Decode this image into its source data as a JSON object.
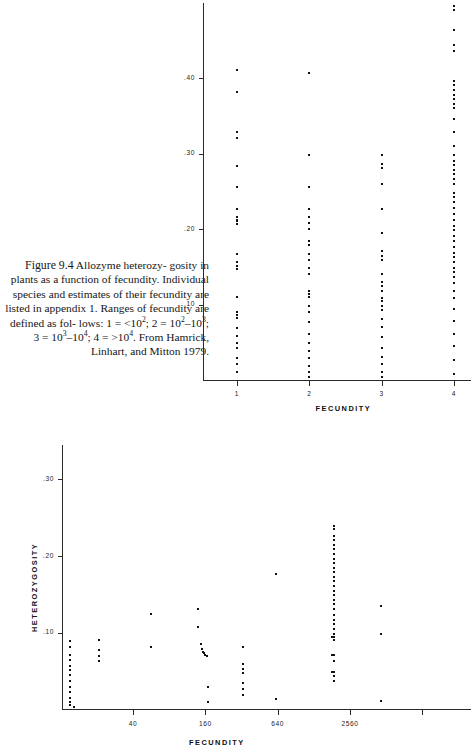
{
  "caption": {
    "figure_number": "Figure 9.4",
    "line1": "Allozyme heterozy-",
    "line2": "gosity in plants as a function of",
    "line3": "fecundity. Individual species",
    "line4": "and estimates of their fecundity",
    "line5": "are listed in appendix 1. Ranges",
    "line6": "of fecundity are defined as fol-",
    "line7_pre": "lows: 1 = <10",
    "line7_sup1": "2",
    "line7_mid1": "; 2 = 10",
    "line7_sup2": "2",
    "line7_dash1": "–10",
    "line7_sup3": "3",
    "line7_end": "; 3",
    "line8_pre": "= 10",
    "line8_sup1": "3",
    "line8_dash": "–10",
    "line8_sup2": "4",
    "line8_mid": "; 4 = >10",
    "line8_sup3": "4",
    "line8_end": ". From",
    "line9": "Hamrick, Linhart, and Mitton",
    "line10": "1979."
  },
  "chart_data": [
    {
      "id": "top",
      "type": "scatter",
      "title": "",
      "xlabel": "FECUNDITY",
      "ylabel": "",
      "x_tick_labels": [
        "1",
        "2",
        "3",
        "4"
      ],
      "x_categories": [
        1,
        2,
        3,
        4
      ],
      "y_tick_labels": [
        ".10",
        ".20",
        ".30",
        ".40"
      ],
      "y_tick_values": [
        0.1,
        0.2,
        0.3,
        0.4
      ],
      "ylim": [
        0.0,
        0.5
      ],
      "grid": false,
      "legend": "none",
      "series": [
        {
          "name": "Fecundity class 1",
          "x": 1,
          "values": [
            0.413,
            0.383,
            0.33,
            0.322,
            0.285,
            0.258,
            0.228,
            0.218,
            0.214,
            0.212,
            0.208,
            0.168,
            0.158,
            0.152,
            0.148,
            0.112,
            0.092,
            0.088,
            0.084,
            0.07,
            0.06,
            0.05,
            0.044,
            0.03,
            0.022,
            0.012
          ]
        },
        {
          "name": "Fecundity class 2",
          "x": 2,
          "values": [
            0.408,
            0.3,
            0.258,
            0.228,
            0.218,
            0.21,
            0.202,
            0.186,
            0.18,
            0.168,
            0.16,
            0.15,
            0.142,
            0.12,
            0.116,
            0.112,
            0.1,
            0.092,
            0.078,
            0.062,
            0.05,
            0.04,
            0.03,
            0.02,
            0.012,
            0.006
          ]
        },
        {
          "name": "Fecundity class 3",
          "x": 3,
          "values": [
            0.3,
            0.288,
            0.282,
            0.262,
            0.228,
            0.196,
            0.172,
            0.166,
            0.16,
            0.142,
            0.132,
            0.126,
            0.12,
            0.11,
            0.106,
            0.1,
            0.094,
            0.082,
            0.072,
            0.058,
            0.044,
            0.032,
            0.022,
            0.012,
            0.006
          ]
        },
        {
          "name": "Fecundity class 4",
          "x": 4,
          "values": [
            0.498,
            0.492,
            0.466,
            0.446,
            0.438,
            0.398,
            0.392,
            0.386,
            0.38,
            0.374,
            0.368,
            0.362,
            0.348,
            0.33,
            0.312,
            0.3,
            0.292,
            0.286,
            0.28,
            0.274,
            0.268,
            0.262,
            0.25,
            0.244,
            0.238,
            0.23,
            0.222,
            0.214,
            0.206,
            0.2,
            0.192,
            0.186,
            0.178,
            0.17,
            0.164,
            0.158,
            0.15,
            0.144,
            0.138,
            0.13,
            0.12,
            0.11,
            0.096,
            0.08,
            0.062,
            0.046,
            0.028,
            0.01
          ]
        }
      ]
    },
    {
      "id": "bottom",
      "type": "scatter",
      "title": "",
      "xlabel": "FECUNDITY",
      "ylabel": "HETEROZYGOSITY",
      "x_scale": "log",
      "x_tick_labels": [
        "40",
        "160",
        "640",
        "2560"
      ],
      "x_tick_values": [
        40,
        160,
        640,
        2560
      ],
      "y_tick_labels": [
        ".10",
        ".20",
        ".30"
      ],
      "y_tick_values": [
        0.1,
        0.2,
        0.3
      ],
      "ylim": [
        0.0,
        0.345
      ],
      "grid": false,
      "legend": "none",
      "points": [
        {
          "x": 10,
          "y": 0.112
        },
        {
          "x": 10,
          "y": 0.068
        },
        {
          "x": 12,
          "y": 0.09
        },
        {
          "x": 12,
          "y": 0.082
        },
        {
          "x": 12,
          "y": 0.072
        },
        {
          "x": 12,
          "y": 0.066
        },
        {
          "x": 12,
          "y": 0.058
        },
        {
          "x": 12,
          "y": 0.052
        },
        {
          "x": 12,
          "y": 0.046
        },
        {
          "x": 12,
          "y": 0.038
        },
        {
          "x": 12,
          "y": 0.03
        },
        {
          "x": 12,
          "y": 0.024
        },
        {
          "x": 12,
          "y": 0.016
        },
        {
          "x": 12,
          "y": 0.01
        },
        {
          "x": 12,
          "y": 0.006
        },
        {
          "x": 13,
          "y": 0.004
        },
        {
          "x": 21,
          "y": 0.092
        },
        {
          "x": 21,
          "y": 0.078
        },
        {
          "x": 21,
          "y": 0.07
        },
        {
          "x": 21,
          "y": 0.064
        },
        {
          "x": 56,
          "y": 0.126
        },
        {
          "x": 56,
          "y": 0.082
        },
        {
          "x": 140,
          "y": 0.132
        },
        {
          "x": 140,
          "y": 0.108
        },
        {
          "x": 148,
          "y": 0.086
        },
        {
          "x": 150,
          "y": 0.08
        },
        {
          "x": 152,
          "y": 0.076
        },
        {
          "x": 156,
          "y": 0.074
        },
        {
          "x": 160,
          "y": 0.072
        },
        {
          "x": 164,
          "y": 0.07
        },
        {
          "x": 168,
          "y": 0.03
        },
        {
          "x": 168,
          "y": 0.01
        },
        {
          "x": 330,
          "y": 0.082
        },
        {
          "x": 330,
          "y": 0.06
        },
        {
          "x": 330,
          "y": 0.054
        },
        {
          "x": 330,
          "y": 0.048
        },
        {
          "x": 330,
          "y": 0.036
        },
        {
          "x": 330,
          "y": 0.028
        },
        {
          "x": 330,
          "y": 0.02
        },
        {
          "x": 620,
          "y": 0.178
        },
        {
          "x": 620,
          "y": 0.014
        },
        {
          "x": 1900,
          "y": 0.24
        },
        {
          "x": 1900,
          "y": 0.236
        },
        {
          "x": 1900,
          "y": 0.228
        },
        {
          "x": 1900,
          "y": 0.222
        },
        {
          "x": 1900,
          "y": 0.216
        },
        {
          "x": 1900,
          "y": 0.21
        },
        {
          "x": 1900,
          "y": 0.204
        },
        {
          "x": 1900,
          "y": 0.198
        },
        {
          "x": 1900,
          "y": 0.192
        },
        {
          "x": 1900,
          "y": 0.186
        },
        {
          "x": 1900,
          "y": 0.18
        },
        {
          "x": 1900,
          "y": 0.174
        },
        {
          "x": 1900,
          "y": 0.168
        },
        {
          "x": 1900,
          "y": 0.162
        },
        {
          "x": 1900,
          "y": 0.156
        },
        {
          "x": 1900,
          "y": 0.15
        },
        {
          "x": 1900,
          "y": 0.144
        },
        {
          "x": 1900,
          "y": 0.138
        },
        {
          "x": 1900,
          "y": 0.132
        },
        {
          "x": 1900,
          "y": 0.124
        },
        {
          "x": 1900,
          "y": 0.118
        },
        {
          "x": 1900,
          "y": 0.112
        },
        {
          "x": 1900,
          "y": 0.106
        },
        {
          "x": 1900,
          "y": 0.1
        },
        {
          "x": 1900,
          "y": 0.096
        },
        {
          "x": 1900,
          "y": 0.092
        },
        {
          "x": 1800,
          "y": 0.096
        },
        {
          "x": 1900,
          "y": 0.072
        },
        {
          "x": 1800,
          "y": 0.072
        },
        {
          "x": 1900,
          "y": 0.064
        },
        {
          "x": 1900,
          "y": 0.05
        },
        {
          "x": 1800,
          "y": 0.05
        },
        {
          "x": 1900,
          "y": 0.044
        },
        {
          "x": 1900,
          "y": 0.038
        },
        {
          "x": 4600,
          "y": 0.136
        },
        {
          "x": 4600,
          "y": 0.1
        },
        {
          "x": 4600,
          "y": 0.012
        }
      ]
    }
  ]
}
